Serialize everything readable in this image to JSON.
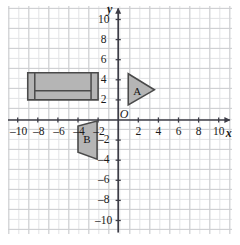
{
  "figure": {
    "type": "coordinate-plane",
    "background": "#ffffff",
    "grid": {
      "minor_color": "#e2e3e5",
      "major_color": "#cdced1",
      "minor_step": 1,
      "major_step": 2,
      "visible": true
    },
    "axes": {
      "color": "#3c3c46",
      "x_label": "x",
      "y_label": "y",
      "origin_label": "O",
      "xlim": [
        -11,
        11
      ],
      "ylim": [
        -11,
        11
      ],
      "x_ticks": [
        -10,
        -8,
        -6,
        -4,
        -2,
        2,
        4,
        6,
        8,
        10
      ],
      "y_ticks": [
        10,
        8,
        6,
        4,
        2,
        -2,
        -4,
        -6,
        -8,
        -10
      ],
      "x_tick_labels": [
        "–10",
        "–8",
        "–6",
        "–4",
        "–2",
        "2",
        "4",
        "6",
        "8",
        "10"
      ],
      "y_tick_labels": [
        "10",
        "8",
        "6",
        "4",
        "2",
        "–2",
        "–4",
        "–6",
        "–8",
        "–10"
      ]
    },
    "style": {
      "shape_fill": "#b5b5b5",
      "shape_stroke": "#4a4a4a",
      "label_color": "#111111"
    }
  },
  "shapes": [
    {
      "id": "rectangle-figure",
      "name": "rectangle",
      "label": "",
      "kind": "rectangle",
      "vertices": [
        [
          -9,
          2
        ],
        [
          -2,
          2
        ],
        [
          -2,
          4.7
        ],
        [
          -9,
          4.7
        ]
      ],
      "inner_segments": [
        [
          [
            -8.3,
            2
          ],
          [
            -8.3,
            4.7
          ]
        ],
        [
          [
            -2.7,
            2
          ],
          [
            -2.7,
            4.7
          ]
        ],
        [
          [
            -8.3,
            2.9
          ],
          [
            -2.7,
            2.9
          ]
        ]
      ]
    },
    {
      "id": "triangle-a",
      "name": "triangle-A",
      "label": "A",
      "kind": "triangle",
      "vertices": [
        [
          1,
          1.5
        ],
        [
          1,
          4.6
        ],
        [
          3.6,
          3.0
        ]
      ],
      "label_position": [
        1.9,
        2.9
      ]
    },
    {
      "id": "triangle-b",
      "name": "triangle-B",
      "label": "B",
      "kind": "triangle",
      "vertices": [
        [
          -2.1,
          -0.1
        ],
        [
          -2.1,
          -3.9
        ],
        [
          -4.0,
          -3.2
        ],
        [
          -4.0,
          -0.6
        ]
      ],
      "label_position": [
        -3.1,
        -1.9
      ]
    }
  ]
}
